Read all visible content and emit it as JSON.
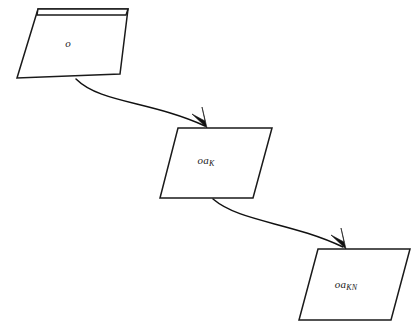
{
  "figure": {
    "type": "flow-diagram",
    "background_color": "#ffffff",
    "stroke_color": "#1a1a1a",
    "width": 415,
    "height": 335
  },
  "nodes": [
    {
      "id": "node-o",
      "label_base": "o",
      "label_sub": "",
      "label_full": "o",
      "shape": "layered-trapezoid",
      "points": "17,78 38,9 128,9 120,74",
      "lid_points": "38,9 128,9 126,15 37,15",
      "label_x": 68,
      "label_y": 44
    },
    {
      "id": "node-oa-k",
      "label_base": "oa",
      "label_sub": "K",
      "label_full": "oaK",
      "shape": "parallelogram",
      "points": "178,128 272,128 253,198 160,198",
      "lid_points": "",
      "label_x": 209,
      "label_y": 161
    },
    {
      "id": "node-oa-kn",
      "label_base": "oa",
      "label_sub": "KN",
      "label_full": "oaKN",
      "shape": "parallelogram",
      "points": "318,249 410,249 391,320 299,320",
      "lid_points": "",
      "label_x": 350,
      "label_y": 285
    }
  ],
  "edges": [
    {
      "id": "edge-o-to-oak",
      "from": "node-o",
      "to": "node-oa-k",
      "style": "curved",
      "path": "M 76,79 C 100,103 150,101 205,126",
      "head_points": "207,128 192,114 205,121 202,107"
    },
    {
      "id": "edge-oak-to-oakn",
      "from": "node-oa-k",
      "to": "node-oa-kn",
      "style": "curved",
      "path": "M 213,199 C 240,222 290,222 343,247",
      "head_points": "346,249 331,235 344,242 341,228"
    }
  ]
}
